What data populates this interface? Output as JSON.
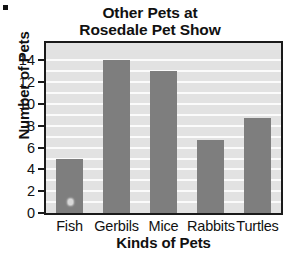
{
  "chart_data": {
    "type": "bar",
    "title": "Other Pets at Rosedale Pet Show",
    "title_lines": [
      "Other Pets at",
      "Rosedale Pet Show"
    ],
    "categories": [
      "Fish",
      "Gerbils",
      "Mice",
      "Rabbits",
      "Turtles"
    ],
    "values": [
      5,
      14,
      13,
      6.7,
      8.7
    ],
    "xlabel": "Kinds of Pets",
    "ylabel": "Number of Pets",
    "ylim": [
      0,
      15.6
    ],
    "yticks": [
      0,
      2,
      4,
      6,
      8,
      10,
      12,
      14
    ],
    "ytick_labels": [
      "0",
      "2",
      "4",
      "6",
      "8",
      "10",
      "12",
      "14"
    ],
    "gridlines": [
      1,
      2,
      3,
      4,
      5,
      6,
      7,
      8,
      9,
      10,
      11,
      12,
      13,
      14
    ],
    "grid": true,
    "grid_color": "#fbfbfb",
    "legend": null,
    "bar_color": "#7e7e7e",
    "plot_background": "#e2e2e2",
    "frame_color": "#1a1a1a",
    "page_background": "#ffffff"
  },
  "artifacts": {
    "corner_mark": "scan-artifact-black-square",
    "fish_bar_speck": "scan-artifact-light-speck"
  }
}
